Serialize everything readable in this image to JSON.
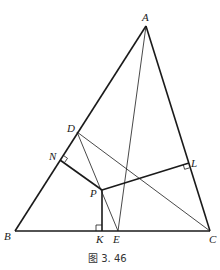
{
  "figure": {
    "caption": "图 3. 46",
    "points": {
      "A": {
        "label": "A",
        "x": 146,
        "y": 26
      },
      "B": {
        "label": "B",
        "x": 15,
        "y": 231
      },
      "C": {
        "label": "C",
        "x": 210,
        "y": 231
      },
      "D": {
        "label": "D",
        "x": 77,
        "y": 132
      },
      "N": {
        "label": "N",
        "x": 60,
        "y": 160
      },
      "P": {
        "label": "P",
        "x": 102,
        "y": 190
      },
      "L": {
        "label": "L",
        "x": 189,
        "y": 163
      },
      "K": {
        "label": "K",
        "x": 102,
        "y": 231
      },
      "E": {
        "label": "E",
        "x": 118,
        "y": 231
      }
    },
    "segments": [
      {
        "from": "A",
        "to": "B",
        "weight": "thick"
      },
      {
        "from": "A",
        "to": "C",
        "weight": "thick"
      },
      {
        "from": "B",
        "to": "C",
        "weight": "thick"
      },
      {
        "from": "P",
        "to": "N",
        "weight": "thick"
      },
      {
        "from": "P",
        "to": "L",
        "weight": "thick"
      },
      {
        "from": "P",
        "to": "K",
        "weight": "thick"
      },
      {
        "from": "A",
        "to": "E",
        "weight": "thin"
      },
      {
        "from": "D",
        "to": "E",
        "weight": "thin"
      },
      {
        "from": "D",
        "to": "C",
        "weight": "thin"
      }
    ],
    "right_angles": [
      "N",
      "L",
      "K"
    ],
    "stroke_color": "#1a1a1a"
  }
}
